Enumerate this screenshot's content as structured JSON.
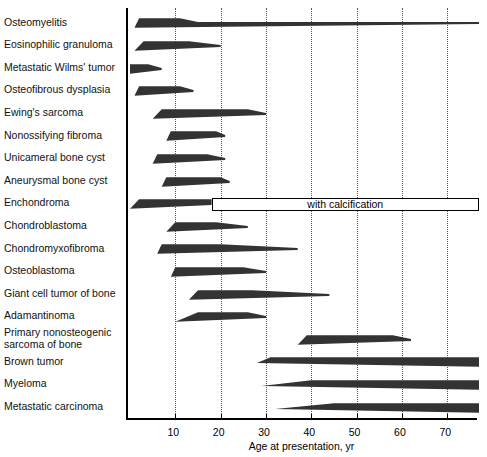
{
  "chart_data": {
    "type": "bar",
    "title": "",
    "subtitle": "",
    "xlabel": "Age at presentation, yr",
    "ylabel": "",
    "xlim": [
      0,
      77
    ],
    "ylim": null,
    "grid": true,
    "legend": null,
    "xticks": [
      10,
      20,
      30,
      40,
      50,
      60,
      70
    ],
    "xticklabels": [
      "10",
      "20",
      "30",
      "40",
      "50",
      "60",
      "70"
    ],
    "orientation": "horizontal",
    "note": "Each row is an age-range band for a bone lesion; band thickness suggests relative frequency. Tapered ends indicate gradual onset/decline; thin tails extend the range.",
    "annotations": [
      {
        "text": "with calcification",
        "attached_to": "Enchondroma",
        "start": 18,
        "end": 77,
        "style": "open-box"
      }
    ],
    "categories": [
      "Osteomyelitis",
      "Eosinophilic granuloma",
      "Metastatic Wilms' tumor",
      "Osteofibrous dysplasia",
      "Ewing's sarcoma",
      "Nonossifying fibroma",
      "Unicameral bone cyst",
      "Aneurysmal bone cyst",
      "Enchondroma",
      "Chondroblastoma",
      "Chondromyxofibroma",
      "Osteoblastoma",
      "Giant cell tumor of bone",
      "Adamantinoma",
      "Primary nonosteogenic sarcoma of bone",
      "Brown tumor",
      "Myeloma",
      "Metastatic carcinoma"
    ],
    "ranges": [
      {
        "label": "Osteomyelitis",
        "start": 1,
        "end": 77,
        "peak_start": 2,
        "peak_end": 11
      },
      {
        "label": "Eosinophilic granuloma",
        "start": 1,
        "end": 20,
        "peak_start": 3,
        "peak_end": 13
      },
      {
        "label": "Metastatic Wilms' tumor",
        "start": 0,
        "end": 7,
        "peak_start": 0,
        "peak_end": 4
      },
      {
        "label": "Osteofibrous dysplasia",
        "start": 1,
        "end": 14,
        "peak_start": 2,
        "peak_end": 11
      },
      {
        "label": "Ewing's sarcoma",
        "start": 5,
        "end": 30,
        "peak_start": 7,
        "peak_end": 26
      },
      {
        "label": "Nonossifying fibroma",
        "start": 8,
        "end": 21,
        "peak_start": 9,
        "peak_end": 19
      },
      {
        "label": "Unicameral bone cyst",
        "start": 5,
        "end": 21,
        "peak_start": 6,
        "peak_end": 17
      },
      {
        "label": "Aneurysmal bone cyst",
        "start": 7,
        "end": 22,
        "peak_start": 8,
        "peak_end": 20
      },
      {
        "label": "Enchondroma",
        "start": 0,
        "end": 18,
        "peak_start": 2,
        "peak_end": 18
      },
      {
        "label": "Chondroblastoma",
        "start": 8,
        "end": 26,
        "peak_start": 10,
        "peak_end": 19
      },
      {
        "label": "Chondromyxofibroma",
        "start": 6,
        "end": 37,
        "peak_start": 7,
        "peak_end": 20
      },
      {
        "label": "Osteoblastoma",
        "start": 9,
        "end": 30,
        "peak_start": 10,
        "peak_end": 25
      },
      {
        "label": "Giant cell tumor of bone",
        "start": 13,
        "end": 44,
        "peak_start": 15,
        "peak_end": 27
      },
      {
        "label": "Adamantinoma",
        "start": 10,
        "end": 30,
        "peak_start": 15,
        "peak_end": 26
      },
      {
        "label": "Primary nonosteogenic sarcoma of bone",
        "start": 37,
        "end": 62,
        "peak_start": 39,
        "peak_end": 58
      },
      {
        "label": "Brown tumor",
        "start": 28,
        "end": 77,
        "peak_start": 31,
        "peak_end": 77
      },
      {
        "label": "Myeloma",
        "start": 29,
        "end": 77,
        "peak_start": 40,
        "peak_end": 77
      },
      {
        "label": "Metastatic carcinoma",
        "start": 32,
        "end": 77,
        "peak_start": 45,
        "peak_end": 77
      }
    ]
  },
  "axis": {
    "xlabel": "Age at presentation, yr"
  },
  "colors": {
    "bar": "#333333",
    "axis": "#000000",
    "grid": "#555555",
    "background": "#ffffff"
  }
}
